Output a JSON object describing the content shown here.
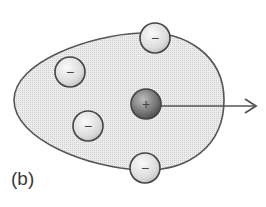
{
  "figure": {
    "label": "(b)"
  },
  "colors": {
    "body_fill": "#e4e4e4",
    "outline": "#555555",
    "negative_fill": "#eeeeee",
    "positive_fill": "#777777",
    "arrow": "#555555"
  },
  "particles": [
    {
      "sign": "−",
      "charge": "negative",
      "cx": 155,
      "cy": 38
    },
    {
      "sign": "−",
      "charge": "negative",
      "cx": 70,
      "cy": 72
    },
    {
      "sign": "+",
      "charge": "positive",
      "cx": 146,
      "cy": 104
    },
    {
      "sign": "−",
      "charge": "negative",
      "cx": 88,
      "cy": 126
    },
    {
      "sign": "−",
      "charge": "negative",
      "cx": 145,
      "cy": 168
    }
  ],
  "arrow": {
    "x1": 161,
    "y1": 106,
    "x2": 256,
    "y2": 106
  }
}
